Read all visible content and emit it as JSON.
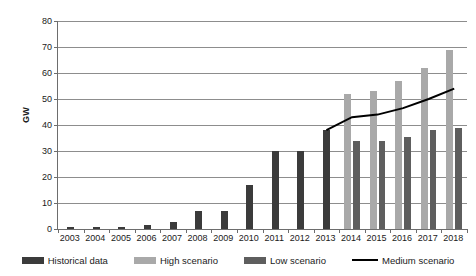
{
  "chart_data": {
    "type": "bar",
    "title": "",
    "subtitle": "",
    "xlabel": "",
    "ylabel": "GW",
    "ylim": [
      0,
      80
    ],
    "yticks": [
      0,
      10,
      20,
      30,
      40,
      50,
      60,
      70,
      80
    ],
    "grid": true,
    "legend_position": "bottom",
    "categories": [
      "2003",
      "2004",
      "2005",
      "2006",
      "2007",
      "2008",
      "2009",
      "2010",
      "2011",
      "2012",
      "2013",
      "2014",
      "2015",
      "2016",
      "2017",
      "2018"
    ],
    "series": [
      {
        "name": "Historical data",
        "type": "bar",
        "color": "#3b3b3b",
        "values": [
          0.6,
          0.8,
          0.9,
          1.7,
          2.7,
          7.0,
          7.0,
          17.0,
          30.0,
          30.0,
          38.0,
          null,
          null,
          null,
          null,
          null
        ]
      },
      {
        "name": "High scenario",
        "type": "bar",
        "color": "#a9a9a9",
        "values": [
          null,
          null,
          null,
          null,
          null,
          null,
          null,
          null,
          null,
          null,
          null,
          52.0,
          53.0,
          57.0,
          62.0,
          69.0
        ]
      },
      {
        "name": "Low scenario",
        "type": "bar",
        "color": "#5e5e5e",
        "values": [
          null,
          null,
          null,
          null,
          null,
          null,
          null,
          null,
          null,
          null,
          null,
          34.0,
          34.0,
          35.5,
          38.0,
          39.0
        ]
      },
      {
        "name": "Medium scenario",
        "type": "line",
        "color": "#000000",
        "values": [
          null,
          null,
          null,
          null,
          null,
          null,
          null,
          null,
          null,
          null,
          38.0,
          43.0,
          44.0,
          46.5,
          50.0,
          54.0
        ]
      }
    ]
  },
  "legend": {
    "items": [
      {
        "label": "Historical data",
        "swatch": "bar-swatch-dark",
        "color": "#3b3b3b"
      },
      {
        "label": "High scenario",
        "swatch": "bar-swatch-light",
        "color": "#a9a9a9"
      },
      {
        "label": "Low scenario",
        "swatch": "bar-swatch-medium",
        "color": "#5e5e5e"
      },
      {
        "label": "Medium scenario",
        "swatch": "line-swatch",
        "color": "#000000"
      }
    ]
  },
  "axes": {
    "y_title": "GW",
    "y_labels": [
      "80",
      "70",
      "60",
      "50",
      "40",
      "30",
      "20",
      "10",
      "0"
    ],
    "x_labels": [
      "2003",
      "2004",
      "2005",
      "2006",
      "2007",
      "2008",
      "2009",
      "2010",
      "2011",
      "2012",
      "2013",
      "2014",
      "2015",
      "2016",
      "2017",
      "2018"
    ]
  }
}
